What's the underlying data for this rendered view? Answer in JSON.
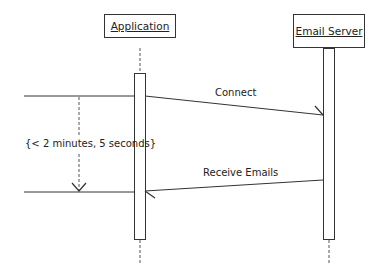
{
  "diagram": {
    "type": "sequence",
    "participants": [
      {
        "id": "application",
        "label": "Application"
      },
      {
        "id": "email_server",
        "label": "Email Server"
      }
    ],
    "messages": [
      {
        "from": "application",
        "to": "email_server",
        "label": "Connect"
      },
      {
        "from": "email_server",
        "to": "application",
        "label": "Receive Emails"
      }
    ],
    "constraint": {
      "label": "{< 2 minutes, 5 seconds}"
    },
    "colors": {
      "line": "#333333",
      "background": "#ffffff"
    }
  }
}
